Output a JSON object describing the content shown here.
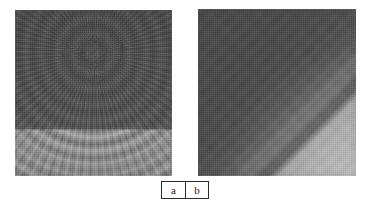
{
  "figure": {
    "background_color": "#ffffff",
    "width": 367,
    "height": 212,
    "panels": [
      {
        "id": "a",
        "label": "a",
        "description": "radial fan interference pattern",
        "dark_region_color": "#4e4e4e",
        "light_region_color": "#8c8c8c",
        "divider_orientation": "horizontal",
        "focus_point": "top-center"
      },
      {
        "id": "b",
        "label": "b",
        "description": "diagonal banded gradient field",
        "dark_region_color": "#4a4a4a",
        "band_color": "#6a6a6a",
        "light_region_color": "#a8a8a8",
        "divider_orientation": "diagonal"
      }
    ]
  },
  "caption": {
    "cells": [
      {
        "label": "a"
      },
      {
        "label": "b"
      }
    ],
    "border_color": "#2b2b2b",
    "text_color": "#171717"
  }
}
